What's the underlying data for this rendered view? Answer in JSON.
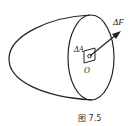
{
  "figure": {
    "caption": "图 7.5",
    "labels": {
      "area": "ΔA",
      "force": "ΔF",
      "point": "O"
    },
    "colors": {
      "stroke": "#222222",
      "background": "#ffffff"
    }
  }
}
